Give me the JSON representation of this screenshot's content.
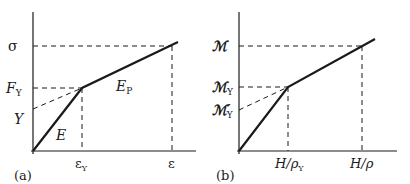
{
  "panel_a": {
    "tag": "(a)",
    "y_labels": {
      "sigma": "σ",
      "Fy_main": "F",
      "Fy_sub": "Y",
      "Y": "Y"
    },
    "x_labels": {
      "eps_y_main": "ε",
      "eps_y_sub": "Y",
      "eps": "ε"
    },
    "line_labels": {
      "E": "E",
      "Ep_main": "E",
      "Ep_sub": "P"
    }
  },
  "panel_b": {
    "tag": "(b)",
    "y_labels": {
      "M": "ℳ",
      "My_main": "ℳ",
      "My_sub": "Y",
      "Mpy_main": "ℳ′",
      "Mpy_sub": "Y"
    },
    "x_labels": {
      "H_rho_y_main": "H/ρ",
      "H_rho_y_sub": "Y",
      "H_rho": "H/ρ"
    }
  },
  "colors": {
    "line": "#1a1a1a",
    "background": "#ffffff"
  }
}
